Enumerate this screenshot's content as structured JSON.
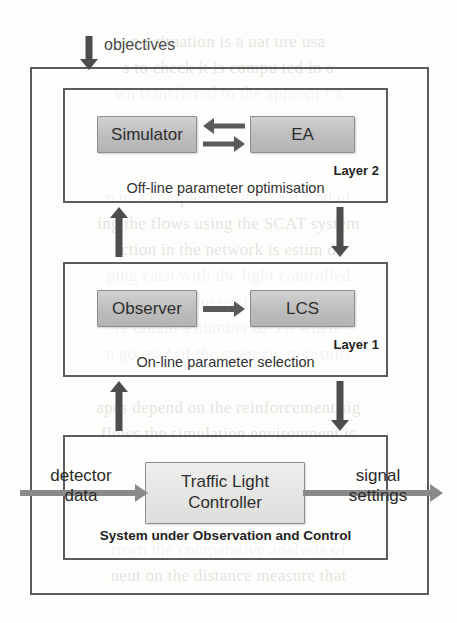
{
  "figure": {
    "colors": {
      "frame_stroke": "#5c5c5c",
      "box_stroke": "#8d8d8d",
      "box_fill_dark": "#bdbdbd",
      "box_fill_light": "#e4e4e2",
      "arrow_dark": "#4d4d4d",
      "arrow_light": "#8a8a8a",
      "text": "#2e2e2e",
      "ghost_text": "rgba(120,115,105,0.20)"
    }
  },
  "input": {
    "objectives_label": "objectives",
    "objectives_arrow_icon": "arrow-down-icon"
  },
  "layer2": {
    "tag": "Layer 2",
    "description": "Off-line parameter optimisation",
    "components": [
      {
        "id": "simulator",
        "label": "Simulator",
        "fill": "dark"
      },
      {
        "id": "ea",
        "label": "EA",
        "fill": "dark"
      }
    ],
    "link_icons": [
      "arrow-left-icon",
      "arrow-right-icon"
    ]
  },
  "layer1": {
    "tag": "Layer 1",
    "description": "On-line parameter selection",
    "components": [
      {
        "id": "observer",
        "label": "Observer",
        "fill": "dark"
      },
      {
        "id": "lcs",
        "label": "LCS",
        "fill": "dark"
      }
    ],
    "link_icons": [
      "arrow-right-icon"
    ]
  },
  "system": {
    "caption": "System under Observation and Control",
    "controller": {
      "line1": "Traffic Light",
      "line2": "Controller",
      "fill": "light"
    },
    "input_label_line1": "detector",
    "input_label_line2": "data",
    "output_label_line1": "signal",
    "output_label_line2": "settings",
    "input_arrow_icon": "arrow-right-icon",
    "output_arrow_icon": "arrow-right-icon"
  },
  "interlayer_arrows": {
    "layer2_to_layer1_up_icon": "arrow-up-icon",
    "layer2_to_layer1_down_icon": "arrow-down-icon",
    "layer1_to_system_up_icon": "arrow-up-icon",
    "layer1_to_system_down_icon": "arrow-down-icon"
  },
  "background_ghost_text": [
    "a  t  situation  is  a  uat  ure usa",
    "s to check it is compu ted in a",
    "wn transferred to the appropr t a",
    "",
    "n to a  completed within a  n  riod of",
    "ing the flows using the SCAT  system",
    "ction  in  the  network  is  estim   d",
    "ping  each  with  the  light  controlled",
    "c  are  conducted  by  the  LC  S",
    "re  obtain  a  number  of  5 h  where",
    "n  go  read  of  the  strategic  rc  results",
    "apes depend on the reinforcement sig",
    "flows  the  simulation  environment  is",
    "rown  the  comparative  analysis  of",
    "neut  on  the  distance  measure  that"
  ]
}
